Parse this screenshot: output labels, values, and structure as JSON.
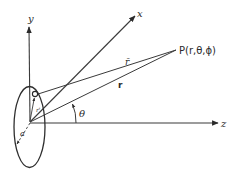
{
  "diagram": {
    "type": "coordinate-geometry",
    "axes": {
      "x_label": "x",
      "y_label": "y",
      "z_label": "z"
    },
    "point": {
      "label": "P(r,θ,ϕ)"
    },
    "vectors": {
      "r_bar_label": "r̄",
      "r_label": "r",
      "r_prime_label": "r'"
    },
    "angle": {
      "label": "θ"
    },
    "loop": {
      "radius_label": "a"
    },
    "colors": {
      "line": "#3a3a3a",
      "background": "#ffffff"
    }
  }
}
